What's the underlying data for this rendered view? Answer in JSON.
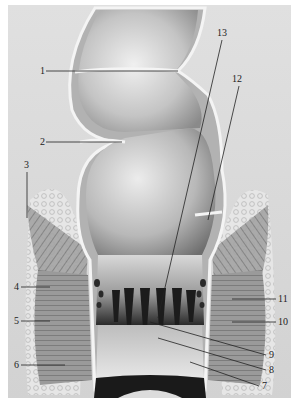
{
  "figure": {
    "type": "anatomical-illustration",
    "style": "grayscale engraving",
    "colors": {
      "background": "#d9d9d9",
      "border": "#ffffff",
      "wall": "#b5b5b5",
      "wall_edge": "#f2f2f2",
      "lumen_light": "#c8c8c8",
      "lumen_dark": "#1e1e1e",
      "muscle": "#8f8f8f",
      "fat": "#ebebeb",
      "leader": "#222222"
    }
  },
  "labels": [
    {
      "id": "1",
      "text": "1",
      "x": 40,
      "y": 74,
      "line": [
        46,
        71,
        178,
        71
      ]
    },
    {
      "id": "2",
      "text": "2",
      "x": 40,
      "y": 145,
      "line": [
        46,
        142,
        122,
        142
      ]
    },
    {
      "id": "3",
      "text": "3",
      "x": 24,
      "y": 168,
      "line": [
        27,
        172,
        27,
        218
      ]
    },
    {
      "id": "4",
      "text": "4",
      "x": 14,
      "y": 290,
      "line": [
        21,
        287,
        50,
        287
      ]
    },
    {
      "id": "5",
      "text": "5",
      "x": 14,
      "y": 324,
      "line": [
        21,
        321,
        50,
        321
      ]
    },
    {
      "id": "6",
      "text": "6",
      "x": 14,
      "y": 368,
      "line": [
        21,
        365,
        65,
        365
      ]
    },
    {
      "id": "7",
      "text": "7",
      "x": 262,
      "y": 389,
      "line": [
        259,
        386,
        190,
        362
      ]
    },
    {
      "id": "8",
      "text": "8",
      "x": 269,
      "y": 373,
      "line": [
        266,
        370,
        158,
        338
      ]
    },
    {
      "id": "9",
      "text": "9",
      "x": 269,
      "y": 358,
      "line": [
        266,
        355,
        150,
        322
      ]
    },
    {
      "id": "10",
      "text": "10",
      "x": 278,
      "y": 325,
      "line": [
        276,
        322,
        232,
        322
      ]
    },
    {
      "id": "11",
      "text": "11",
      "x": 278,
      "y": 302,
      "line": [
        276,
        299,
        232,
        299
      ]
    },
    {
      "id": "12",
      "text": "12",
      "x": 232,
      "y": 82,
      "line": [
        239,
        86,
        208,
        220
      ]
    },
    {
      "id": "13",
      "text": "13",
      "x": 217,
      "y": 36,
      "line": [
        222,
        40,
        158,
        318
      ]
    }
  ]
}
